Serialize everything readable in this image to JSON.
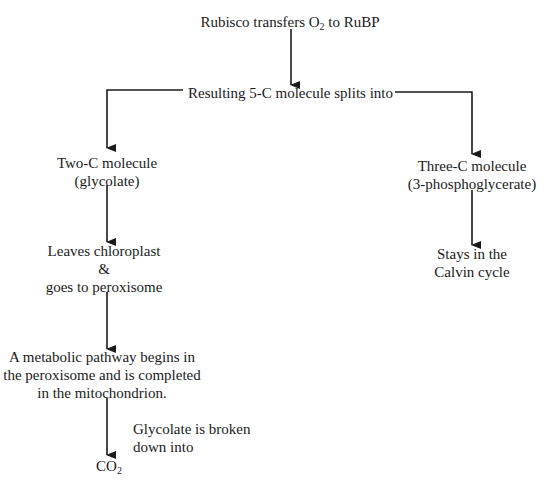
{
  "diagram": {
    "type": "flowchart",
    "nodes": {
      "start": {
        "pre": "Rubisco transfers O",
        "sub": "2",
        "post": " to RuBP"
      },
      "split": "Resulting 5-C molecule splits into",
      "two_c": {
        "line1": "Two-C molecule",
        "line2": "(glycolate)"
      },
      "three_c": {
        "line1": "Three-C molecule",
        "line2": "(3-phosphoglycerate)"
      },
      "stays": {
        "line1": "Stays in the",
        "line2": "Calvin cycle"
      },
      "leaves": {
        "line1": "Leaves chloroplast",
        "line2": "&",
        "line3": "goes to peroxisome"
      },
      "pathway": {
        "line1": "A metabolic pathway begins in",
        "line2": "the peroxisome and is completed",
        "line3": "in the mitochondrion."
      },
      "broken_label": {
        "line1": "Glycolate is broken",
        "line2": "down into"
      },
      "co2": {
        "pre": "CO",
        "sub": "2"
      }
    },
    "edges": [
      {
        "from": "start",
        "to": "split"
      },
      {
        "from": "split",
        "to": "two_c"
      },
      {
        "from": "split",
        "to": "three_c"
      },
      {
        "from": "three_c",
        "to": "stays"
      },
      {
        "from": "two_c",
        "to": "leaves"
      },
      {
        "from": "leaves",
        "to": "pathway"
      },
      {
        "from": "pathway",
        "to": "co2",
        "label": "Glycolate is broken down into"
      }
    ],
    "colors": {
      "line": "#1a1a1a",
      "background": "#ffffff"
    }
  }
}
